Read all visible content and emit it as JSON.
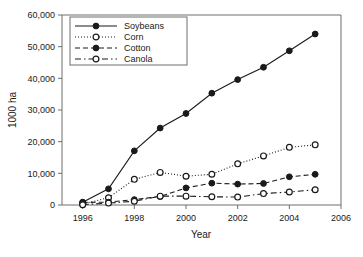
{
  "chart_data": {
    "type": "line",
    "title": "",
    "xlabel": "Year",
    "ylabel": "1000 ha",
    "xlim": [
      1995.2,
      2006.0
    ],
    "ylim": [
      0,
      60000
    ],
    "x_ticks": [
      1996,
      1998,
      2000,
      2002,
      2004,
      2006
    ],
    "x_tick_labels": [
      "1996",
      "1998",
      "2000",
      "2002",
      "2004",
      "2006"
    ],
    "y_ticks": [
      0,
      10000,
      20000,
      30000,
      40000,
      50000,
      60000
    ],
    "y_tick_labels": [
      "0",
      "10,000",
      "20,000",
      "30,000",
      "40,000",
      "50,000",
      "60,000"
    ],
    "grid": false,
    "legend_position": "upper-left",
    "x": [
      1996,
      1997,
      1998,
      1999,
      2000,
      2001,
      2002,
      2003,
      2004,
      2005
    ],
    "series": [
      {
        "name": "Soybeans",
        "values": [
          900,
          5100,
          17100,
          24300,
          28900,
          35300,
          39600,
          43500,
          48700,
          54000
        ],
        "line_style": "solid",
        "marker": "filled-circle",
        "color": "#1a1a1a"
      },
      {
        "name": "Corn",
        "values": [
          300,
          2300,
          8100,
          10300,
          9100,
          9700,
          13000,
          15500,
          18200,
          19000
        ],
        "line_style": "dotted",
        "marker": "open-circle",
        "color": "#1a1a1a"
      },
      {
        "name": "Cotton",
        "values": [
          800,
          900,
          1700,
          2700,
          5400,
          6900,
          6600,
          6800,
          8900,
          9700
        ],
        "line_style": "dashed",
        "marker": "filled-circle",
        "color": "#1a1a1a"
      },
      {
        "name": "Canola",
        "values": [
          100,
          600,
          1200,
          2800,
          2800,
          2600,
          2500,
          3600,
          4100,
          4800
        ],
        "line_style": "dash-dot",
        "marker": "open-circle",
        "color": "#1a1a1a"
      }
    ]
  },
  "legend": {
    "entries": [
      {
        "label": "Soybeans"
      },
      {
        "label": "Corn"
      },
      {
        "label": "Cotton"
      },
      {
        "label": "Canola"
      }
    ]
  },
  "axes": {
    "y_label": "1000 ha",
    "x_label": "Year"
  }
}
